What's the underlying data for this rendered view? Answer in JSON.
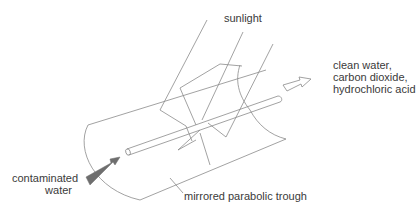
{
  "diagram": {
    "labels": {
      "sunlight": "sunlight",
      "output_line1": "clean water,",
      "output_line2": "carbon dioxide,",
      "output_line3": "hydrochloric acid",
      "input_line1": "contaminated",
      "input_line2": "water",
      "trough": "mirrored parabolic trough"
    },
    "colors": {
      "line": "#8a8a8a",
      "text": "#3a3a3a",
      "input_arrow": "#6e6e6e",
      "background": "#ffffff"
    }
  }
}
